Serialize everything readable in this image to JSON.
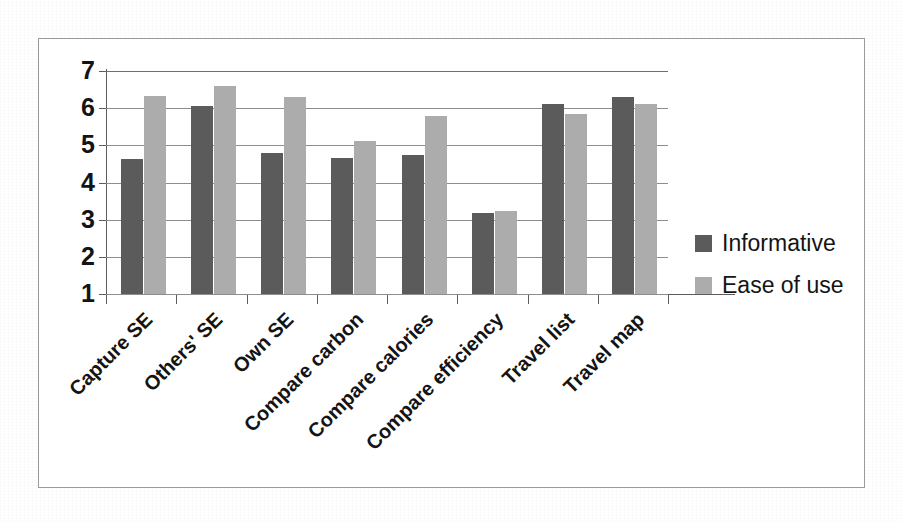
{
  "chart_data": {
    "type": "bar",
    "title": "",
    "subtitle": "",
    "xlabel": "",
    "ylabel": "",
    "ylim": [
      1,
      7
    ],
    "yticks": [
      1,
      2,
      3,
      4,
      5,
      6,
      7
    ],
    "ytick_labels": [
      "1",
      "2",
      "3",
      "4",
      "5",
      "6",
      "7"
    ],
    "grid": true,
    "grid_axis": "y",
    "legend_position": "right",
    "categories": [
      "Capture SE",
      "Others' SE",
      "Own SE",
      "Compare carbon",
      "Compare calories",
      "Compare efficiency",
      "Travel list",
      "Travel map"
    ],
    "series": [
      {
        "name": "Informative",
        "color": "#5b5b5b",
        "values": [
          4.62,
          6.05,
          4.8,
          4.65,
          4.73,
          3.17,
          6.12,
          6.3
        ]
      },
      {
        "name": "Ease of use",
        "color": "#acacac",
        "values": [
          6.33,
          6.6,
          6.3,
          5.12,
          5.8,
          3.23,
          5.85,
          6.12
        ]
      }
    ]
  },
  "legend": {
    "items": [
      {
        "label": "Informative",
        "color": "#5b5b5b"
      },
      {
        "label": "Ease of use",
        "color": "#acacac"
      }
    ]
  },
  "colors": {
    "series_informative": "#5b5b5b",
    "series_ease_of_use": "#acacac",
    "gridline": "#8d8d8d",
    "axis": "#5c5c5c",
    "frame_border": "#9a9a9a",
    "text": "#141414",
    "background": "#ffffff"
  }
}
